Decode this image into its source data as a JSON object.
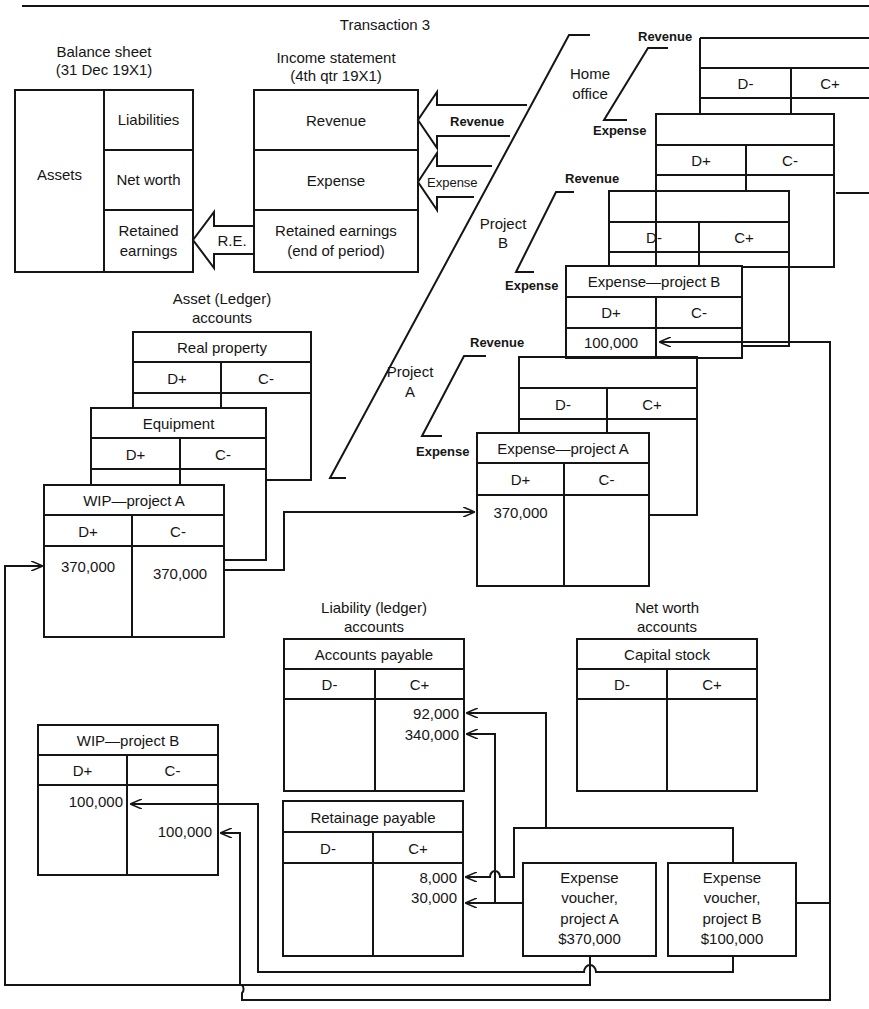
{
  "title": "Transaction 3",
  "balance_sheet": {
    "heading_line1": "Balance sheet",
    "heading_line2": "(31 Dec 19X1)",
    "assets": "Assets",
    "liabilities": "Liabilities",
    "net_worth": "Net worth",
    "retained_line1": "Retained",
    "retained_line2": "earnings"
  },
  "re_arrow_label": "R.E.",
  "income_statement": {
    "heading_line1": "Income statement",
    "heading_line2": "(4th qtr 19X1)",
    "revenue": "Revenue",
    "expense": "Expense",
    "retained_line1": "Retained earnings",
    "retained_line2": "(end of period)"
  },
  "arrows": {
    "revenue": "Revenue",
    "expense": "Expense"
  },
  "divisions": {
    "home_office_line1": "Home",
    "home_office_line2": "office",
    "project_b_line1": "Project",
    "project_b_line2": "B",
    "project_a_line1": "Project",
    "project_a_line2": "A"
  },
  "bracket_labels": {
    "revenue": "Revenue",
    "expense": "Expense"
  },
  "debit_plus": "D+",
  "debit_minus": "D-",
  "credit_plus": "C+",
  "credit_minus": "C-",
  "expense_project_b": {
    "title": "Expense—project B",
    "debit_entry": "100,000"
  },
  "expense_project_a": {
    "title": "Expense—project A",
    "debit_entry": "370,000"
  },
  "asset_accounts": {
    "heading_line1": "Asset (Ledger)",
    "heading_line2": "accounts",
    "real_property": {
      "title": "Real property"
    },
    "equipment": {
      "title": "Equipment"
    },
    "wip_project_a": {
      "title": "WIP—project A",
      "debit_entry": "370,000",
      "credit_entry": "370,000"
    },
    "wip_project_b": {
      "title": "WIP—project B",
      "debit_entry": "100,000",
      "credit_entry": "100,000"
    }
  },
  "liability_accounts": {
    "heading_line1": "Liability (ledger)",
    "heading_line2": "accounts",
    "accounts_payable": {
      "title": "Accounts payable",
      "credit_entries": [
        "92,000",
        "340,000"
      ]
    },
    "retainage_payable": {
      "title": "Retainage payable",
      "credit_entries": [
        "8,000",
        "30,000"
      ]
    }
  },
  "net_worth_accounts": {
    "heading_line1": "Net worth",
    "heading_line2": "accounts",
    "capital_stock": {
      "title": "Capital stock"
    }
  },
  "vouchers": {
    "project_a": {
      "line1": "Expense",
      "line2": "voucher,",
      "line3": "project A",
      "amount": "$370,000"
    },
    "project_b": {
      "line1": "Expense",
      "line2": "voucher,",
      "line3": "project B",
      "amount": "$100,000"
    }
  },
  "colors": {
    "ink": "#151515",
    "paper": "#ffffff"
  }
}
